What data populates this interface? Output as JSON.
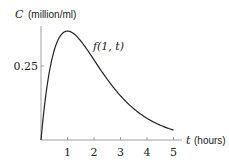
{
  "chart_data": {
    "type": "line",
    "title": "",
    "xlabel": "t (hours)",
    "ylabel": "C (million/ml)",
    "x_ticks": [
      1,
      2,
      3,
      4,
      5
    ],
    "y_ticks": [
      0.25
    ],
    "xlim": [
      0,
      5.2
    ],
    "ylim": [
      0,
      0.4
    ],
    "grid": false,
    "series": [
      {
        "name": "f(1, t)",
        "x": [
          0,
          0.25,
          0.5,
          0.75,
          1,
          1.5,
          2,
          2.5,
          3,
          3.5,
          4,
          4.5,
          5
        ],
        "values": [
          0,
          0.195,
          0.303,
          0.354,
          0.368,
          0.335,
          0.271,
          0.205,
          0.149,
          0.106,
          0.073,
          0.05,
          0.034
        ]
      }
    ],
    "annotations": [
      "f(1, t)"
    ]
  },
  "labels": {
    "y_axis_var": "C",
    "y_axis_unit": "(million/ml)",
    "x_axis_var": "t",
    "x_axis_unit": "(hours)",
    "y_tick": "0.25",
    "curve_label": "f(1, t)",
    "x_ticks": [
      "1",
      "2",
      "3",
      "4",
      "5"
    ]
  }
}
